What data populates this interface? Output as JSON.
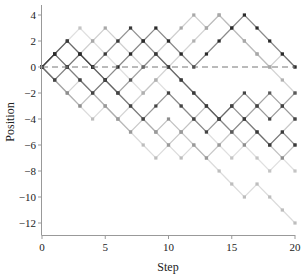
{
  "chart_data": {
    "type": "line",
    "title": "",
    "xlabel": "Step",
    "ylabel": "Position",
    "xlim": [
      0,
      20
    ],
    "ylim": [
      -13,
      4.8
    ],
    "xticks": [
      0,
      5,
      10,
      15,
      20
    ],
    "yticks": [
      4,
      2,
      0,
      -2,
      -4,
      -6,
      -8,
      -10,
      -12
    ],
    "grid": false,
    "legend": null,
    "reference_line": {
      "y": 0,
      "style": "dashed",
      "color": "#777777"
    },
    "x": [
      0,
      1,
      2,
      3,
      4,
      5,
      6,
      7,
      8,
      9,
      10,
      11,
      12,
      13,
      14,
      15,
      16,
      17,
      18,
      19,
      20
    ],
    "series": [
      {
        "name": "walk-1",
        "color": "#bdbdbd",
        "values": [
          0,
          -1,
          -2,
          -3,
          -4,
          -3,
          -4,
          -5,
          -6,
          -7,
          -6,
          -7,
          -6,
          -7,
          -8,
          -9,
          -10,
          -9,
          -10,
          -11,
          -12
        ]
      },
      {
        "name": "walk-2",
        "color": "#c4c4c4",
        "values": [
          0,
          1,
          2,
          3,
          2,
          1,
          0,
          -1,
          -2,
          -1,
          -2,
          -3,
          -4,
          -5,
          -6,
          -7,
          -6,
          -7,
          -8,
          -7,
          -8
        ]
      },
      {
        "name": "walk-3",
        "color": "#b0b0b0",
        "values": [
          0,
          -1,
          -2,
          -1,
          -2,
          -3,
          -4,
          -3,
          -2,
          -1,
          0,
          1,
          2,
          3,
          4,
          3,
          2,
          1,
          0,
          -1,
          -2
        ]
      },
      {
        "name": "walk-4",
        "color": "#a8a8a8",
        "values": [
          0,
          -1,
          0,
          1,
          2,
          3,
          2,
          1,
          0,
          1,
          2,
          3,
          4,
          3,
          4,
          3,
          2,
          1,
          0,
          1,
          0
        ]
      },
      {
        "name": "walk-5",
        "color": "#8e8e8e",
        "values": [
          0,
          -1,
          -2,
          -3,
          -2,
          -1,
          -2,
          -3,
          -4,
          -5,
          -4,
          -5,
          -4,
          -3,
          -4,
          -5,
          -6,
          -5,
          -6,
          -7,
          -6
        ]
      },
      {
        "name": "walk-6",
        "color": "#9a9a9a",
        "values": [
          0,
          1,
          0,
          -1,
          -2,
          -3,
          -4,
          -5,
          -4,
          -5,
          -6,
          -5,
          -6,
          -7,
          -6,
          -5,
          -4,
          -5,
          -6,
          -5,
          -4
        ]
      },
      {
        "name": "walk-7",
        "color": "#5a5a5a",
        "values": [
          0,
          1,
          2,
          1,
          0,
          -1,
          -2,
          -1,
          0,
          1,
          0,
          -1,
          -2,
          -3,
          -4,
          -5,
          -4,
          -3,
          -2,
          -3,
          -2
        ]
      },
      {
        "name": "walk-8",
        "color": "#3a3a3a",
        "values": [
          0,
          1,
          2,
          1,
          0,
          1,
          2,
          3,
          2,
          1,
          0,
          -1,
          -2,
          -3,
          -4,
          -3,
          -4,
          -5,
          -6,
          -5,
          -6
        ]
      },
      {
        "name": "walk-9",
        "color": "#2a2a2a",
        "values": [
          0,
          1,
          0,
          1,
          0,
          -1,
          0,
          1,
          2,
          3,
          2,
          1,
          0,
          1,
          2,
          3,
          4,
          3,
          2,
          1,
          0
        ]
      },
      {
        "name": "walk-10",
        "color": "#444444",
        "values": [
          0,
          -1,
          0,
          -1,
          -2,
          -1,
          -2,
          -3,
          -4,
          -3,
          -2,
          -3,
          -4,
          -5,
          -4,
          -3,
          -2,
          -3,
          -4,
          -3,
          -4
        ]
      }
    ]
  }
}
